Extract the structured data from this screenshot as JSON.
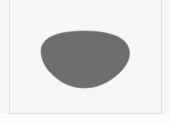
{
  "image": {
    "width": 170,
    "height": 123,
    "description": "Grayscale silhouette of a rounded organic blob shape centered on a pale off-white panel",
    "caption": ""
  },
  "panel": {
    "background_color": "#f6f6f4",
    "outer_background_color": "#ffffff",
    "frame": {
      "left_rule_color": "#dfdfdd",
      "right_rule_color": "#dcdcda",
      "bottom_rule_color": "#dedede",
      "left_x": 9,
      "right_x": 161,
      "bottom_y": 113
    },
    "paper_shade_color": "#fbfbfa"
  },
  "shape": {
    "name": "blob-silhouette",
    "fill_color": "#6d6d6d",
    "edge_color": "#7a7a7a",
    "bounds": {
      "left": 41,
      "top": 31,
      "right": 130,
      "bottom": 88,
      "width": 89,
      "height": 57
    },
    "path": "M 85 31 C 101 31 116 34 123 40 C 130 46 131 54 128 61 C 124 70 114 79 103 84 C 94 88 84 89 75 87 C 65 85 56 79 49 71 C 44 65 41 58 41 51 C 41 44 46 38 55 35 C 63 32 74 31 85 31 Z"
  }
}
